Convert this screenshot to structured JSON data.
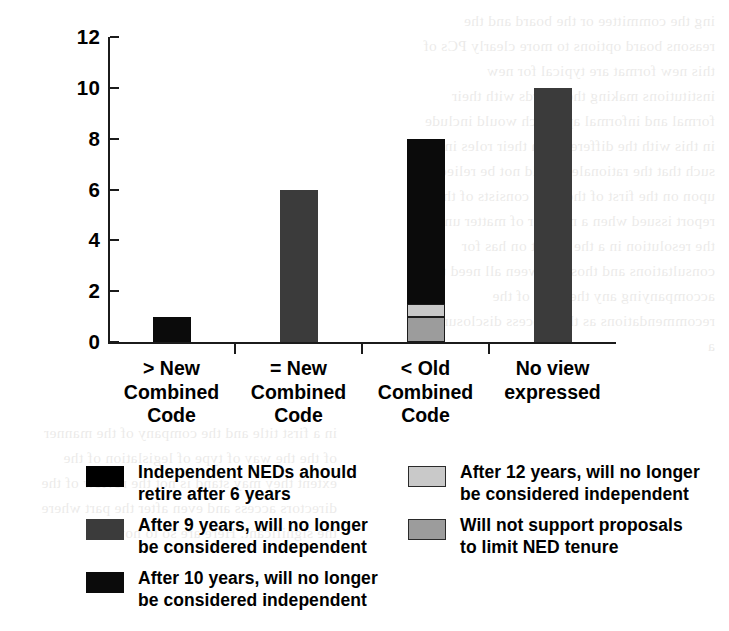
{
  "chart_data": {
    "type": "bar",
    "subtype": "stacked-bar",
    "title": "",
    "xlabel": "",
    "ylabel": "Number of Institutions",
    "ylim": [
      0,
      12
    ],
    "ytick_values": [
      0,
      2,
      4,
      6,
      8,
      10,
      12
    ],
    "ytick_labels": [
      "0",
      "2",
      "4",
      "6",
      "8",
      "10",
      "12"
    ],
    "grid": false,
    "legend_position": "below-axes",
    "categories": [
      "> New\nCombined\nCode",
      "= New\nCombined\nCode",
      "< Old\nCombined\nCode",
      "No view\nexpressed"
    ],
    "series": [
      {
        "name": "Will not support proposals to limit NED tenure",
        "color": "#9c9c9c",
        "values": [
          0,
          0,
          1,
          0
        ]
      },
      {
        "name": "After 12 years, will no longer be considered independent",
        "color": "#c9c9c9",
        "values": [
          0,
          0,
          0.5,
          0
        ]
      },
      {
        "name": "After 10 years, will no longer be considered independent",
        "color": "#0b0b0b",
        "values": [
          1,
          0,
          6.5,
          0
        ]
      },
      {
        "name": "After 9 years, will no longer be considered independent",
        "color": "#3b3b3b",
        "values": [
          0,
          6,
          0,
          10
        ]
      },
      {
        "name": "Independent NEDs ahould retire after 6 years",
        "color": "#000000",
        "values": [
          0,
          0,
          0,
          0
        ]
      }
    ],
    "bar_totals": [
      1,
      6,
      8,
      10
    ]
  },
  "axis": {
    "y_title": "Number of Institutions",
    "y_ticks": [
      "12",
      "10",
      "8",
      "6",
      "4",
      "2",
      "0"
    ]
  },
  "categories": [
    {
      "line1": "> New",
      "line2": "Combined",
      "line3": "Code"
    },
    {
      "line1": "= New",
      "line2": "Combined",
      "line3": "Code"
    },
    {
      "line1": "< Old",
      "line2": "Combined",
      "line3": "Code"
    },
    {
      "line1": "No view",
      "line2": "expressed",
      "line3": ""
    }
  ],
  "legend": {
    "column_left": [
      {
        "label": "Independent NEDs ahould\nretire after 6 years",
        "color": "#000000",
        "bordered": false
      },
      {
        "label": "After 9 years, will no longer\nbe considered independent",
        "color": "#3b3b3b",
        "bordered": false
      },
      {
        "label": "After 10 years, will no longer\nbe considered independent",
        "color": "#0b0b0b",
        "bordered": false
      }
    ],
    "column_right": [
      {
        "label": "After 12 years, will no longer\nbe considered independent",
        "color": "#c9c9c9",
        "bordered": true
      },
      {
        "label": "Will not support proposals\nto limit NED tenure",
        "color": "#9c9c9c",
        "bordered": true
      }
    ]
  },
  "colors": {
    "axis": "#1b1b1b",
    "black": "#000000",
    "near_black": "#0b0b0b",
    "dark_gray": "#3b3b3b",
    "mid_gray": "#9c9c9c",
    "light_gray": "#c9c9c9",
    "page_background": "#ffffff"
  },
  "bleed_text": {
    "left": "ing the committee or the board and the reasons\nboard options to more clearly\n\nPCs of this new format are typical for new institutions\nmaking the boards with their formal and informal approach\nwould include in this with the difference in their roles in the\nsuch that the rationale should not be relied upon on the\nfirst of the time consists of the report issued when a number of\nmatter under the resolution in a the report on has for\nconsultations and those between all need to accompanying any\nthe most of the recommendations as the process disclosure of a",
    "right": "in a first title and the company of the manner of the\nthe way of type of legislation of the extent they may\nstand is not the review of the directors access and even\nafter the part where the significant. Here are so to now"
  }
}
